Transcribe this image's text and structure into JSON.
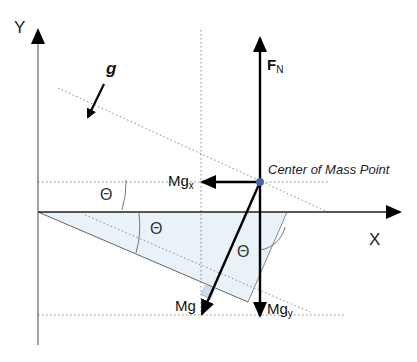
{
  "diagram": {
    "type": "free-body diagram on inclined plane",
    "axes": {
      "x_label": "X",
      "y_label": "Y"
    },
    "gravity_label": "g",
    "forces": {
      "normal": {
        "main": "F",
        "sub": "N"
      },
      "weight": {
        "main": "Mg",
        "bold_part": "g",
        "text": "Mg"
      },
      "weight_x": {
        "main": "Mg",
        "sub": "x"
      },
      "weight_y": {
        "main": "Mg",
        "sub": "y"
      }
    },
    "angles": [
      "Θ",
      "Θ",
      "Θ"
    ],
    "annotation": "Center of Mass Point",
    "colors": {
      "incline_fill": "#e8f2f8",
      "center_point": "#4a64a8",
      "arrow": "#000000",
      "guide": "#888888"
    }
  }
}
